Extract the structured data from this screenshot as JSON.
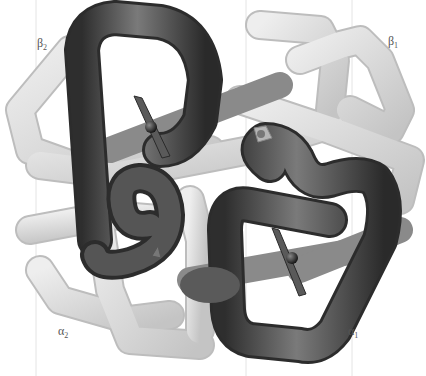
{
  "figure": {
    "subunits": [
      {
        "id": "beta2",
        "symbol": "β",
        "index": "2",
        "shade": "dark",
        "pos": [
          37,
          36
        ]
      },
      {
        "id": "beta1",
        "symbol": "β",
        "index": "1",
        "shade": "light",
        "pos": [
          388,
          34
        ]
      },
      {
        "id": "alpha2",
        "symbol": "α",
        "index": "2",
        "shade": "light",
        "pos": [
          58,
          324
        ]
      },
      {
        "id": "alpha1",
        "symbol": "α",
        "index": "1",
        "shade": "dark",
        "pos": [
          348,
          324
        ]
      }
    ],
    "heme_groups": 4,
    "colors": {
      "dark_chain": "#4a4a4a",
      "light_chain": "#d6d6d6",
      "heme_plate": "#5a5a5a",
      "iron": "#222222",
      "label": "#555555",
      "background": "#ffffff"
    }
  }
}
